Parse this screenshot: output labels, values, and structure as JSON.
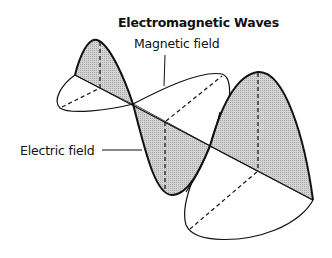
{
  "diagram": {
    "title": "Electromagnetic Waves",
    "labels": {
      "magnetic": "Magnetic field",
      "electric": "Electric field"
    },
    "colors": {
      "stroke": "#111111",
      "shaded_fill": "#c4c4c4",
      "background": "#ffffff"
    }
  }
}
